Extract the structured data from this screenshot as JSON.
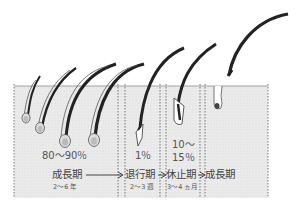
{
  "diagram": {
    "colors": {
      "skin": "#e6e6e6",
      "skin_line": "#8a8a8a",
      "hair": "#222222",
      "divider": "#777777",
      "text": "#444444"
    },
    "phases": [
      {
        "name": "成長期",
        "duration": "2〜6 年",
        "percent": "80〜90％"
      },
      {
        "name": "退行期",
        "duration": "2〜3 週",
        "percent": "1％"
      },
      {
        "name": "休止期",
        "duration": "3〜4 ヵ月",
        "percent_line1": "10〜",
        "percent_line2": "15％"
      },
      {
        "name": "成長期"
      }
    ],
    "arrow_glyph": "→"
  }
}
